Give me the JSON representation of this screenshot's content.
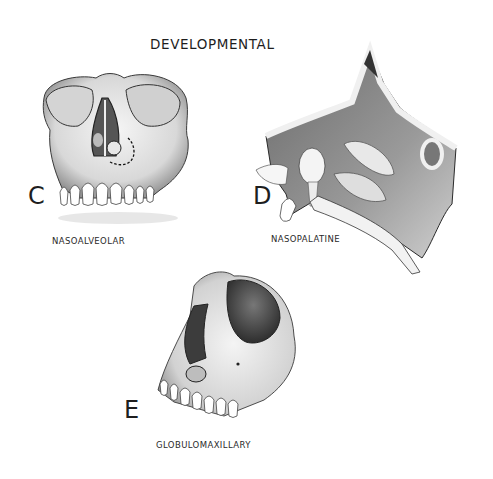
{
  "figure": {
    "title": "DEVELOPMENTAL",
    "panels": [
      {
        "letter": "C",
        "caption": "NASOALVEOLAR",
        "illustration": "frontal-skull-nasoalveolar-cyst"
      },
      {
        "letter": "D",
        "caption": "NASOPALATINE",
        "illustration": "sagittal-nasal-cavity-nasopalatine-cyst"
      },
      {
        "letter": "E",
        "caption": "GLOBULOMAXILLARY",
        "illustration": "oblique-skull-globulomaxillary-cyst"
      }
    ]
  },
  "colors": {
    "background": "#ffffff",
    "ink": "#1e1e1e",
    "bone_light": "#f2f2f2",
    "bone_shade": "#9a9a9a",
    "cavity_dark": "#4a4a4a"
  }
}
